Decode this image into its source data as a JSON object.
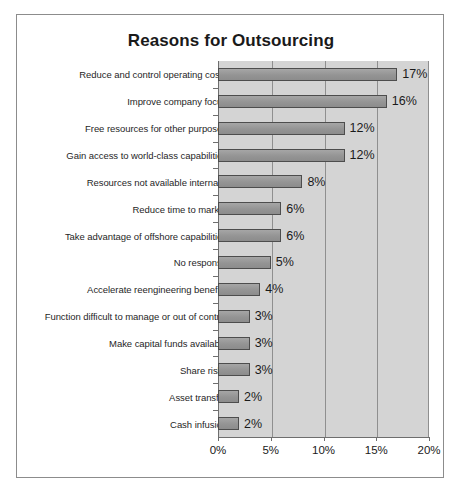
{
  "chart_data": {
    "type": "bar",
    "orientation": "horizontal",
    "title": "Reasons for Outsourcing",
    "xlabel": "",
    "ylabel": "",
    "xlim": [
      0,
      20
    ],
    "grid": true,
    "legend": false,
    "tick_labels": [
      "0%",
      "5%",
      "10%",
      "15%",
      "20%"
    ],
    "tick_values": [
      0,
      5,
      10,
      15,
      20
    ],
    "categories": [
      "Reduce and control operating costs",
      "Improve company focus",
      "Free resources for other purposes",
      "Gain access to world-class capabilities",
      "Resources not available internally",
      "Reduce time to market",
      "Take advantage of offshore capabilities",
      "No response",
      "Accelerate reengineering benefits",
      "Function difficult to manage or out of control",
      "Make capital funds available",
      "Share risks",
      "Asset transfer",
      "Cash infusion"
    ],
    "values": [
      17,
      16,
      12,
      12,
      8,
      6,
      6,
      5,
      4,
      3,
      3,
      3,
      2,
      2
    ],
    "value_labels": [
      "17%",
      "16%",
      "12%",
      "12%",
      "8%",
      "6%",
      "6%",
      "5%",
      "4%",
      "3%",
      "3%",
      "3%",
      "2%",
      "2%"
    ],
    "colors": {
      "bar_fill": "#9a9a9a",
      "bar_border": "#4d4d4d",
      "plot_background": "#d4d4d4",
      "gridline": "#8f8f8f",
      "axis": "#6e6e6e",
      "text": "#1a1a1a",
      "frame_border": "#8c8c8c",
      "page_background": "#ffffff"
    }
  }
}
